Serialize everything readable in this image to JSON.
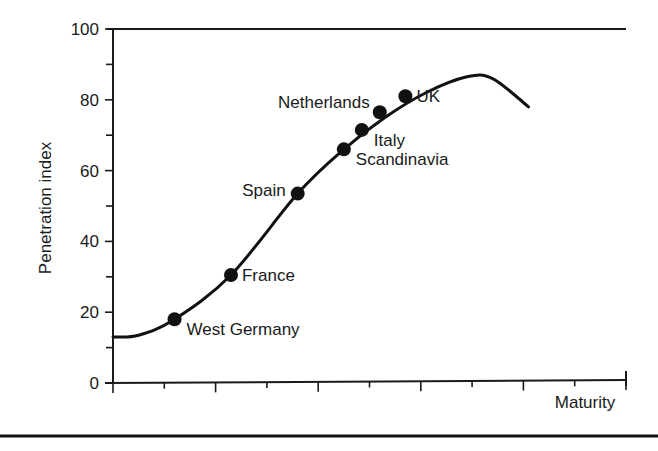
{
  "chart_data": {
    "type": "line",
    "title": "",
    "xlabel": "Maturity",
    "ylabel": "Penetration index",
    "ylim": [
      0,
      100
    ],
    "xlim": [
      0,
      10
    ],
    "y_ticks_major": [
      0,
      20,
      40,
      60,
      80,
      100
    ],
    "y_ticks_minor": [
      10,
      30,
      50,
      70,
      90
    ],
    "y_tick_labels": [
      "0",
      "20",
      "40",
      "60",
      "80",
      "100"
    ],
    "x_ticks_major": [
      0,
      2,
      4,
      6,
      8,
      10
    ],
    "x_ticks_minor": [
      1,
      3,
      5,
      7,
      9
    ],
    "x_tick_labels": [],
    "grid": false,
    "legend": "none",
    "series": [
      {
        "name": "Penetration curve",
        "x": [
          0,
          0.5,
          1.2,
          2.3,
          3.6,
          4.5,
          5.3,
          6.1,
          6.9,
          7.4,
          8.1
        ],
        "y": [
          13,
          13.5,
          18,
          30.5,
          53.5,
          66,
          75,
          82,
          86.5,
          86,
          78
        ]
      }
    ],
    "points": [
      {
        "label": "West Germany",
        "x": 1.2,
        "y": 18,
        "label_pos": "below-right"
      },
      {
        "label": "France",
        "x": 2.3,
        "y": 30.5,
        "label_pos": "right"
      },
      {
        "label": "Spain",
        "x": 3.6,
        "y": 53.5,
        "label_pos": "left"
      },
      {
        "label": "Scandinavia",
        "x": 4.5,
        "y": 66,
        "label_pos": "below-right"
      },
      {
        "label": "Italy",
        "x": 4.85,
        "y": 71.5,
        "label_pos": "below-right"
      },
      {
        "label": "Netherlands",
        "x": 5.2,
        "y": 76.5,
        "label_pos": "upper-left"
      },
      {
        "label": "UK",
        "x": 5.7,
        "y": 81,
        "label_pos": "right"
      }
    ]
  }
}
